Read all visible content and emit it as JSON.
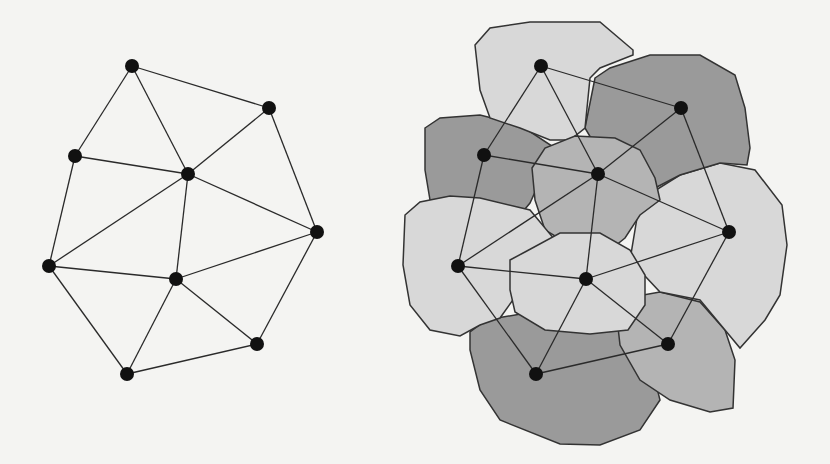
{
  "diagram": {
    "title": "",
    "colors": {
      "background": "#f4f4f2",
      "edge": "#2a2a2a",
      "node": "#111111",
      "region_light": "#d8d8d8",
      "region_mid": "#b4b4b4",
      "region_dark": "#9a9a9a",
      "outline": "#333333"
    },
    "left_graph": {
      "nodes": [
        {
          "id": "A",
          "x": 132,
          "y": 66
        },
        {
          "id": "B",
          "x": 269,
          "y": 108
        },
        {
          "id": "C",
          "x": 75,
          "y": 156
        },
        {
          "id": "D",
          "x": 188,
          "y": 174
        },
        {
          "id": "E",
          "x": 317,
          "y": 232
        },
        {
          "id": "F",
          "x": 49,
          "y": 266
        },
        {
          "id": "G",
          "x": 176,
          "y": 279
        },
        {
          "id": "H",
          "x": 257,
          "y": 344
        },
        {
          "id": "I",
          "x": 127,
          "y": 374
        }
      ],
      "edges": [
        [
          "A",
          "B"
        ],
        [
          "A",
          "C"
        ],
        [
          "A",
          "D"
        ],
        [
          "B",
          "D"
        ],
        [
          "B",
          "E"
        ],
        [
          "C",
          "D"
        ],
        [
          "C",
          "F"
        ],
        [
          "D",
          "F"
        ],
        [
          "D",
          "G"
        ],
        [
          "D",
          "E"
        ],
        [
          "F",
          "G"
        ],
        [
          "F",
          "I"
        ],
        [
          "G",
          "E"
        ],
        [
          "G",
          "I"
        ],
        [
          "G",
          "H"
        ],
        [
          "E",
          "H"
        ],
        [
          "I",
          "H"
        ]
      ]
    },
    "right_graph": {
      "nodes": [
        {
          "id": "A",
          "x": 541,
          "y": 66
        },
        {
          "id": "B",
          "x": 681,
          "y": 108
        },
        {
          "id": "C",
          "x": 484,
          "y": 155
        },
        {
          "id": "D",
          "x": 598,
          "y": 174
        },
        {
          "id": "E",
          "x": 729,
          "y": 232
        },
        {
          "id": "F",
          "x": 458,
          "y": 266
        },
        {
          "id": "G",
          "x": 586,
          "y": 279
        },
        {
          "id": "H",
          "x": 668,
          "y": 344
        },
        {
          "id": "I",
          "x": 536,
          "y": 374
        }
      ],
      "edges": [
        [
          "A",
          "B"
        ],
        [
          "A",
          "C"
        ],
        [
          "A",
          "D"
        ],
        [
          "B",
          "D"
        ],
        [
          "B",
          "E"
        ],
        [
          "C",
          "D"
        ],
        [
          "C",
          "F"
        ],
        [
          "D",
          "F"
        ],
        [
          "D",
          "G"
        ],
        [
          "D",
          "E"
        ],
        [
          "F",
          "G"
        ],
        [
          "F",
          "I"
        ],
        [
          "G",
          "E"
        ],
        [
          "G",
          "I"
        ],
        [
          "G",
          "H"
        ],
        [
          "E",
          "H"
        ],
        [
          "I",
          "H"
        ]
      ],
      "regions": [
        {
          "node": "I",
          "shade": "dark",
          "path": "M470,332 L486,320 L600,300 L640,320 L650,360 L660,400 L640,430 L600,445 L560,444 L500,420 L480,390 L470,350 Z"
        },
        {
          "node": "H",
          "shade": "mid",
          "path": "M615,300 L660,292 L700,302 L725,330 L735,360 L733,408 L710,412 L670,400 L640,380 L620,345 Z"
        },
        {
          "node": "E",
          "shade": "light",
          "path": "M640,200 L680,175 L720,163 L755,170 L782,205 L787,245 L780,295 L765,320 L740,348 L700,300 L660,292 L630,260 Z"
        },
        {
          "node": "B",
          "shade": "dark",
          "path": "M595,78 L610,68 L650,55 L700,55 L735,75 L745,108 L750,148 L747,165 L720,163 L680,175 L655,188 L640,170 L598,150 L585,128 Z"
        },
        {
          "node": "C",
          "shade": "dark",
          "path": "M425,128 L440,118 L480,115 L520,125 L555,148 L545,170 L530,203 L520,215 L470,215 L430,200 L425,170 Z"
        },
        {
          "node": "A",
          "shade": "light",
          "path": "M475,45 L490,28 L530,22 L600,22 L633,50 L633,55 L600,68 L590,78 L585,128 L570,140 L550,140 L520,128 L490,118 L480,90 Z"
        },
        {
          "node": "D",
          "shade": "mid",
          "path": "M532,168 L545,148 L575,136 L615,138 L640,150 L655,178 L660,200 L640,215 L625,238 L610,250 L570,245 L545,230 L535,200 Z"
        },
        {
          "node": "F",
          "shade": "light",
          "path": "M405,215 L420,202 L450,196 L480,198 L530,210 L555,240 L560,262 L520,290 L500,318 L480,325 L460,336 L430,330 L410,305 L403,265 Z"
        },
        {
          "node": "G",
          "shade": "light",
          "path": "M510,260 L525,252 L560,233 L600,233 L630,250 L645,275 L645,305 L628,330 L590,334 L545,330 L515,312 L510,290 Z"
        }
      ]
    }
  }
}
